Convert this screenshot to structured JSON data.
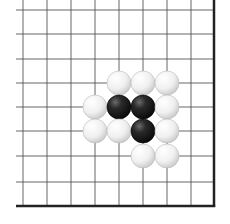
{
  "board": {
    "description": "Go board corner fragment (lower-right corner)",
    "colors": {
      "background": "#ffffff",
      "grid_line": "#555555",
      "edge_line": "#222222",
      "black_stone": "#1a1a1a",
      "white_stone": "#f4f4f4"
    },
    "grid": {
      "x_lines": [
        23,
        47,
        71,
        95,
        119,
        143,
        167,
        191
      ],
      "y_lines": [
        10,
        34,
        59,
        83,
        107,
        131,
        156,
        182
      ],
      "right_edge_x": 214,
      "bottom_edge_y": 206,
      "left_start_x": 16,
      "top_start_y": 0
    },
    "stone_radius": 12,
    "stones": [
      {
        "color": "white",
        "col": 4,
        "row": 3
      },
      {
        "color": "white",
        "col": 5,
        "row": 3
      },
      {
        "color": "white",
        "col": 6,
        "row": 3
      },
      {
        "color": "white",
        "col": 3,
        "row": 4
      },
      {
        "color": "black",
        "col": 4,
        "row": 4
      },
      {
        "color": "black",
        "col": 5,
        "row": 4
      },
      {
        "color": "white",
        "col": 6,
        "row": 4
      },
      {
        "color": "white",
        "col": 3,
        "row": 5
      },
      {
        "color": "white",
        "col": 4,
        "row": 5
      },
      {
        "color": "black",
        "col": 5,
        "row": 5
      },
      {
        "color": "white",
        "col": 6,
        "row": 5
      },
      {
        "color": "white",
        "col": 5,
        "row": 6
      },
      {
        "color": "white",
        "col": 6,
        "row": 6
      }
    ]
  }
}
